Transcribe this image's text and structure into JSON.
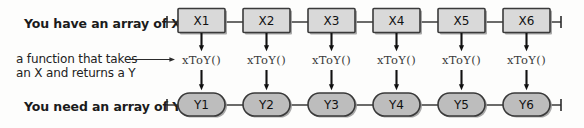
{
  "diagram": {
    "title_top": "You have an array of Xs",
    "title_bottom": "You need an array of Ys",
    "note_line1": "a function that takes",
    "note_line2": "an X and returns a Y",
    "x_nodes": [
      "X1",
      "X2",
      "X3",
      "X4",
      "X5",
      "X6"
    ],
    "y_nodes": [
      "Y1",
      "Y2",
      "Y3",
      "Y4",
      "Y5",
      "Y6"
    ],
    "function_labels": [
      "xToY()",
      "xToY()",
      "xToY()",
      "xToY()",
      "xToY()",
      "xToY()"
    ],
    "colors": {
      "background": "#fdfdfc",
      "box_fill": "#d9d9d9",
      "ellipse_fill": "#bdbdbd",
      "stroke": "#3a3a3a",
      "text": "#111111",
      "function_text": "#3b3b3b"
    }
  }
}
